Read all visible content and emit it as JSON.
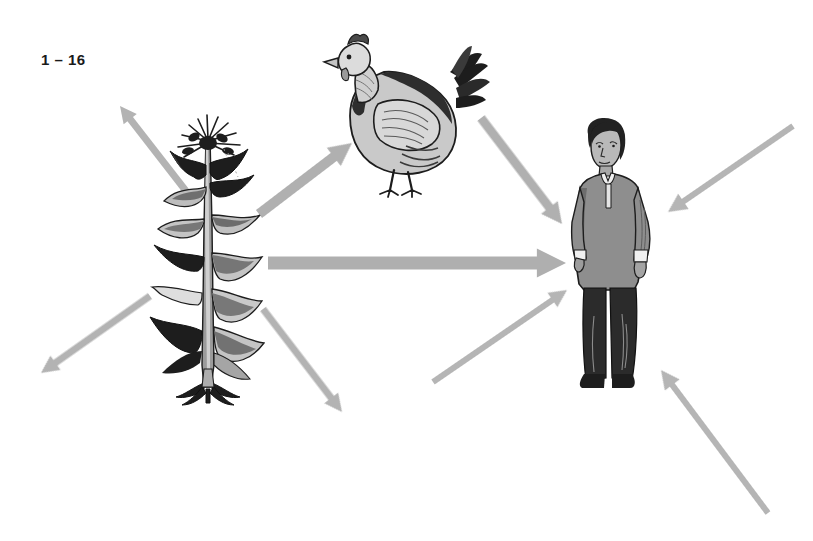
{
  "figure": {
    "label": "1 – 16",
    "caption_text": "",
    "background_color": "#ffffff",
    "width": 813,
    "height": 541
  },
  "palette": {
    "arrow_gray": "#b0b0b0",
    "arrow_gray_dark": "#a0a0a0",
    "ink_black": "#1a1a1a",
    "mid_gray": "#8a8a8a",
    "light_gray": "#c8c8c8",
    "pale_gray": "#dcdcdc",
    "tunic_gray": "#8e8e8e",
    "tunic_shadow": "#6d6d6d",
    "skin_gray": "#b9b9b9",
    "hair_black": "#222222",
    "pants_black": "#2b2b2b"
  },
  "subjects": [
    {
      "id": "corn-plant",
      "name": "corn-plant-illustration",
      "label": "corn plant",
      "x": 148,
      "y": 125,
      "width": 120,
      "height": 270
    },
    {
      "id": "chicken",
      "name": "chicken-illustration",
      "label": "chicken",
      "x": 322,
      "y": 20,
      "width": 165,
      "height": 165
    },
    {
      "id": "person",
      "name": "person-illustration",
      "label": "person",
      "x": 572,
      "y": 118,
      "width": 92,
      "height": 280
    }
  ],
  "arrows": [
    {
      "id": "plant-to-upper-left",
      "name": "arrow-plant-to-upper-left",
      "from": "corn-plant",
      "to": "off-frame-upper-left",
      "x1": 186,
      "y1": 191,
      "x2": 120,
      "y2": 106,
      "thickness": 7,
      "head": 16,
      "color": "#b3b3b3"
    },
    {
      "id": "plant-to-chicken",
      "name": "arrow-plant-to-chicken",
      "from": "corn-plant",
      "to": "chicken",
      "x1": 259,
      "y1": 214,
      "x2": 352,
      "y2": 143,
      "thickness": 10,
      "head": 22,
      "color": "#b0b0b0"
    },
    {
      "id": "plant-to-person",
      "name": "arrow-plant-to-person",
      "from": "corn-plant",
      "to": "person",
      "x1": 268,
      "y1": 263,
      "x2": 566,
      "y2": 263,
      "thickness": 13,
      "head": 28,
      "color": "#afafaf"
    },
    {
      "id": "plant-to-lower-left",
      "name": "arrow-plant-to-lower-left",
      "from": "corn-plant",
      "to": "off-frame-lower-left",
      "x1": 150,
      "y1": 296,
      "x2": 41,
      "y2": 373,
      "thickness": 7,
      "head": 17,
      "color": "#b3b3b3"
    },
    {
      "id": "plant-to-lower-right",
      "name": "arrow-plant-to-lower-right",
      "from": "corn-plant",
      "to": "off-frame-lower-right",
      "x1": 263,
      "y1": 309,
      "x2": 342,
      "y2": 412,
      "thickness": 7,
      "head": 17,
      "color": "#b3b3b3"
    },
    {
      "id": "chicken-to-person",
      "name": "arrow-chicken-to-person",
      "from": "chicken",
      "to": "person",
      "x1": 481,
      "y1": 118,
      "x2": 562,
      "y2": 224,
      "thickness": 9,
      "head": 20,
      "color": "#b0b0b0"
    },
    {
      "id": "lower-left-to-person",
      "name": "arrow-lower-left-to-person",
      "from": "off-frame-lower-left",
      "to": "person",
      "x1": 433,
      "y1": 382,
      "x2": 567,
      "y2": 290,
      "thickness": 6,
      "head": 17,
      "color": "#b5b5b5"
    },
    {
      "id": "upper-right-to-person",
      "name": "arrow-upper-right-to-person",
      "from": "off-frame-upper-right",
      "to": "person",
      "x1": 793,
      "y1": 126,
      "x2": 668,
      "y2": 212,
      "thickness": 6,
      "head": 18,
      "color": "#b5b5b5"
    },
    {
      "id": "lower-right-to-person",
      "name": "arrow-lower-right-to-person",
      "from": "off-frame-lower-right",
      "to": "person",
      "x1": 768,
      "y1": 513,
      "x2": 661,
      "y2": 370,
      "thickness": 6,
      "head": 18,
      "color": "#b5b5b5"
    }
  ]
}
